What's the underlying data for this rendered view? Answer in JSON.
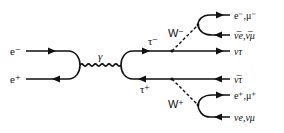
{
  "diagram": {
    "type": "feynman",
    "labels": {
      "e_minus": "e⁻",
      "e_plus": "e⁺",
      "photon": "γ",
      "tau_minus": "τ⁻",
      "tau_plus": "τ⁺",
      "w_minus": "W⁻",
      "w_plus": "W⁺",
      "out_top_lepton": "e⁻,μ⁻",
      "out_top_antineutrino": "ν̅e,ν̅μ",
      "out_nu_tau": "ντ",
      "out_antinu_tau": "ν̅τ",
      "out_bottom_lepton": "e⁺,μ⁺",
      "out_bottom_neutrino": "νe,νμ"
    },
    "colors": {
      "ink": "#111111",
      "background": "#ffffff"
    }
  }
}
